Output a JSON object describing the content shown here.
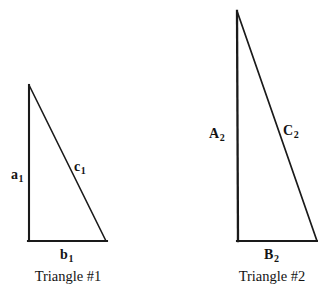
{
  "figure": {
    "background_color": "#ffffff",
    "stroke_color": "#1a1a1a",
    "text_color": "#141414",
    "triangles": [
      {
        "id": "triangle-1",
        "caption": "Triangle #1",
        "apex": {
          "x": 29,
          "y": 85
        },
        "bottom_left": {
          "x": 29,
          "y": 241
        },
        "bottom_right": {
          "x": 106,
          "y": 241
        },
        "labels": {
          "vertical_leg": {
            "base": "a",
            "subscript": "1"
          },
          "hypotenuse": {
            "base": "c",
            "subscript": "1"
          },
          "horizontal_leg": {
            "base": "b",
            "subscript": "1"
          }
        }
      },
      {
        "id": "triangle-2",
        "caption": "Triangle #2",
        "apex": {
          "x": 237,
          "y": 11
        },
        "bottom_left": {
          "x": 238,
          "y": 241
        },
        "bottom_right": {
          "x": 318,
          "y": 241
        },
        "labels": {
          "vertical_leg": {
            "base": "A",
            "subscript": "2"
          },
          "hypotenuse": {
            "base": "C",
            "subscript": "2"
          },
          "horizontal_leg": {
            "base": "B",
            "subscript": "2"
          }
        }
      }
    ]
  }
}
